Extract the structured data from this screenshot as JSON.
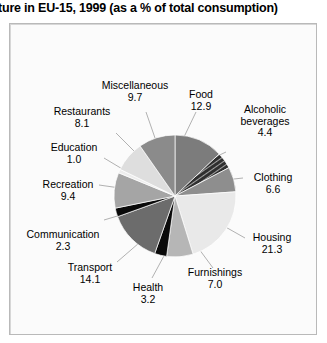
{
  "title": "ture in EU-15, 1999 (as a % of total consumption)",
  "chart_data": {
    "type": "pie",
    "title": "ture in EU-15, 1999 (as a % of total consumption)",
    "unit": "% of total consumption",
    "total": 100.0,
    "legend": "none",
    "labels_position": "outside-with-leader-lines",
    "start_angle_deg": 0,
    "direction": "clockwise",
    "categories": [
      "Food",
      "Alcoholic beverages",
      "Clothing",
      "Housing",
      "Furnishings",
      "Health",
      "Transport",
      "Communication",
      "Recreation",
      "Education",
      "Restaurants",
      "Miscellaneous"
    ],
    "values": [
      12.9,
      4.4,
      6.6,
      21.3,
      7.0,
      3.2,
      14.1,
      2.3,
      9.4,
      1.0,
      8.1,
      9.7
    ],
    "slices": [
      {
        "label": "Food",
        "value": 12.9,
        "color": "#7c7c7c",
        "pattern": "solid"
      },
      {
        "label": "Alcoholic beverages",
        "value": 4.4,
        "color": "#3a3a3a",
        "pattern": "hatched"
      },
      {
        "label": "Clothing",
        "value": 6.6,
        "color": "#8e8e8e",
        "pattern": "solid"
      },
      {
        "label": "Housing",
        "value": 21.3,
        "color": "#e9e9e9",
        "pattern": "solid"
      },
      {
        "label": "Furnishings",
        "value": 7.0,
        "color": "#b6b6b6",
        "pattern": "solid"
      },
      {
        "label": "Health",
        "value": 3.2,
        "color": "#0a0a0a",
        "pattern": "solid"
      },
      {
        "label": "Transport",
        "value": 14.1,
        "color": "#6c6c6c",
        "pattern": "solid"
      },
      {
        "label": "Communication",
        "value": 2.3,
        "color": "#0a0a0a",
        "pattern": "solid"
      },
      {
        "label": "Recreation",
        "value": 9.4,
        "color": "#a5a5a5",
        "pattern": "solid"
      },
      {
        "label": "Education",
        "value": 1.0,
        "color": "#ededed",
        "pattern": "solid"
      },
      {
        "label": "Restaurants",
        "value": 8.1,
        "color": "#dedede",
        "pattern": "solid"
      },
      {
        "label": "Miscellaneous",
        "value": 9.7,
        "color": "#8b8b8b",
        "pattern": "solid"
      }
    ]
  },
  "labels": {
    "food": {
      "name": "Food",
      "value": "12.9"
    },
    "alcoholic": {
      "name": "Alcoholic",
      "name2": "beverages",
      "value": "4.4"
    },
    "clothing": {
      "name": "Clothing",
      "value": "6.6"
    },
    "housing": {
      "name": "Housing",
      "value": "21.3"
    },
    "furnishings": {
      "name": "Furnishings",
      "value": "7.0"
    },
    "health": {
      "name": "Health",
      "value": "3.2"
    },
    "transport": {
      "name": "Transport",
      "value": "14.1"
    },
    "communication": {
      "name": "Communication",
      "value": "2.3"
    },
    "recreation": {
      "name": "Recreation",
      "value": "9.4"
    },
    "education": {
      "name": "Education",
      "value": "1.0"
    },
    "restaurants": {
      "name": "Restaurants",
      "value": "8.1"
    },
    "misc": {
      "name": "Miscellaneous",
      "value": "9.7"
    }
  },
  "colors": {
    "panel_bg": "#fbfbfb",
    "panel_border": "#b9b9b9",
    "text": "#000000",
    "leader_line": "#aaaaaa"
  }
}
